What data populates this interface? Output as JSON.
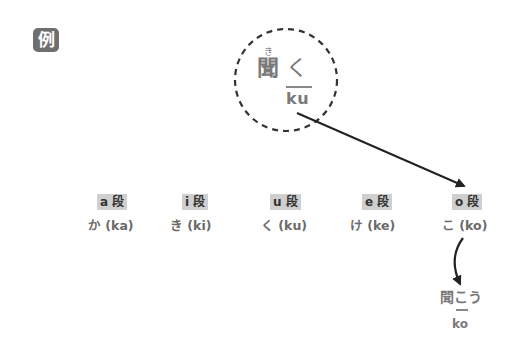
{
  "badge": {
    "label": "例"
  },
  "example": {
    "furigana": "き",
    "kanji": "聞",
    "okurigana": "く",
    "romaji": "ku"
  },
  "columns": [
    {
      "dan": "a 段",
      "kana": "か (ka)"
    },
    {
      "dan": "i 段",
      "kana": "き (ki)"
    },
    {
      "dan": "u 段",
      "kana": "く (ku)"
    },
    {
      "dan": "e 段",
      "kana": "け (ke)"
    },
    {
      "dan": "o 段",
      "kana": "こ (ko)"
    }
  ],
  "result": {
    "kanji": "聞",
    "kana": "こう",
    "underlined_kana": "こ",
    "romaji": "ko"
  },
  "colors": {
    "text": "#777777",
    "label_bg": "#cfcfcf",
    "arrow": "#222222",
    "badge_bg": "#6f6f6f"
  }
}
